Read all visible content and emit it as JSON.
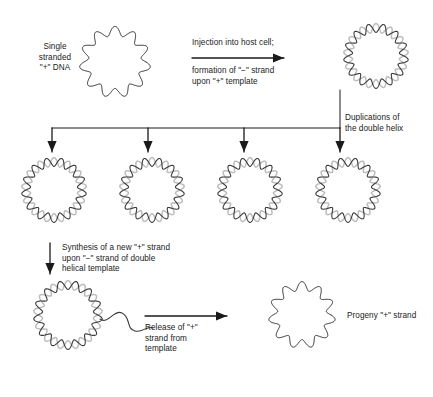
{
  "figure": {
    "width": 433,
    "height": 397,
    "background": "#ffffff",
    "ink_color": "#1a1a1a",
    "strand_colors": {
      "plus_strand": "#3a3a3a",
      "minus_strand": "#bdbdbd"
    }
  },
  "labels": {
    "single_stranded_dna": "Single\nstranded\n\"+\" DNA",
    "injection": "Injection into host cell;",
    "formation": "formation of \"−\" strand\nupon \"+\" template",
    "duplications": "Duplications of\nthe double helix",
    "synthesis": "Synthesis of a new \"+\" strand\nupon \"−\" strand of double\nhelical template",
    "release": "Release of \"+\"\nstrand from\ntemplate",
    "progeny": "Progeny \"+\" strand"
  },
  "molecules": [
    {
      "name": "parental-single-strand-circle",
      "type": "single",
      "cx": 115,
      "cy": 62,
      "r": 31,
      "lobes": 11,
      "amp": 4.6
    },
    {
      "name": "double-helix-circle-initial",
      "type": "double",
      "cx": 376,
      "cy": 56,
      "r": 28,
      "lobes": 13,
      "amp": 4.4
    },
    {
      "name": "double-helix-circle-1",
      "type": "double",
      "cx": 54,
      "cy": 190,
      "r": 28,
      "lobes": 13,
      "amp": 4.4
    },
    {
      "name": "double-helix-circle-2",
      "type": "double",
      "cx": 152,
      "cy": 190,
      "r": 28,
      "lobes": 13,
      "amp": 4.4
    },
    {
      "name": "double-helix-circle-3",
      "type": "double",
      "cx": 250,
      "cy": 190,
      "r": 28,
      "lobes": 13,
      "amp": 4.4
    },
    {
      "name": "double-helix-circle-4",
      "type": "double",
      "cx": 348,
      "cy": 190,
      "r": 28,
      "lobes": 13,
      "amp": 4.4
    },
    {
      "name": "double-helix-circle-with-peeling-strand",
      "type": "double-tail",
      "cx": 68,
      "cy": 315,
      "r": 30,
      "lobes": 13,
      "amp": 4.4
    },
    {
      "name": "progeny-single-strand-circle",
      "type": "single",
      "cx": 302,
      "cy": 315,
      "r": 29,
      "lobes": 11,
      "amp": 4.4
    }
  ],
  "arrows": [
    {
      "name": "injection-arrow",
      "orientation": "horizontal",
      "x1": 192,
      "y1": 58,
      "x2": 284,
      "y2": 58
    },
    {
      "name": "duplication-stem",
      "orientation": "vertical",
      "x1": 340,
      "y1": 90,
      "x2": 340,
      "y2": 128
    },
    {
      "name": "duplication-bar",
      "orientation": "horizontal",
      "x1": 52,
      "y1": 128,
      "x2": 340,
      "y2": 128
    },
    {
      "name": "branch-arrow-1",
      "orientation": "vertical",
      "x1": 52,
      "y1": 128,
      "x2": 52,
      "y2": 152
    },
    {
      "name": "branch-arrow-2",
      "orientation": "vertical",
      "x1": 148,
      "y1": 128,
      "x2": 148,
      "y2": 152
    },
    {
      "name": "branch-arrow-3",
      "orientation": "vertical",
      "x1": 244,
      "y1": 128,
      "x2": 244,
      "y2": 152
    },
    {
      "name": "branch-arrow-4",
      "orientation": "vertical",
      "x1": 340,
      "y1": 128,
      "x2": 340,
      "y2": 152
    },
    {
      "name": "synthesis-arrow",
      "orientation": "vertical",
      "x1": 50,
      "y1": 243,
      "x2": 50,
      "y2": 274
    },
    {
      "name": "release-arrow",
      "orientation": "horizontal",
      "x1": 145,
      "y1": 316,
      "x2": 227,
      "y2": 316
    }
  ]
}
